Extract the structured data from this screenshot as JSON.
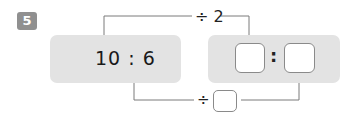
{
  "problem": {
    "number": "5"
  },
  "left_ratio": {
    "text": "10 : 6"
  },
  "right_ratio": {
    "separator": ":",
    "first_value": "",
    "second_value": ""
  },
  "top_operation": {
    "label": "÷ 2"
  },
  "bottom_operation": {
    "symbol": "÷",
    "value": ""
  },
  "colors": {
    "panel": "#e3e3e3",
    "badge": "#909090",
    "line": "#7a7a7a"
  }
}
